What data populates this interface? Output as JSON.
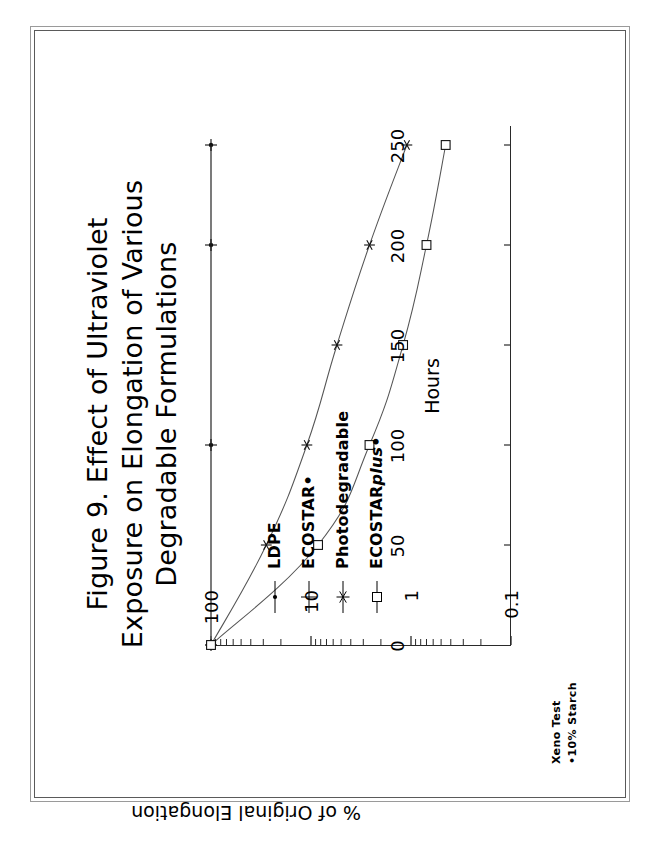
{
  "figure": {
    "title": "Figure 9.  Effect of Ultraviolet\nExposure on Elongation of Various\nDegradable Formulations",
    "footnote": "Xeno Test\n•10% Starch"
  },
  "chart_data": {
    "type": "line",
    "title": "Figure 9.  Effect of Ultraviolet Exposure on Elongation of Various Degradable Formulations",
    "xlabel": "Hours",
    "ylabel": "% of Original Elongation",
    "xlim": [
      0,
      260
    ],
    "ylim": [
      0.1,
      100
    ],
    "yscale": "log",
    "xscale": "linear",
    "grid": false,
    "legend_position": "inside-left",
    "xticks": [
      "0",
      "50",
      "100",
      "150",
      "200",
      "250"
    ],
    "xtick_values": [
      0,
      50,
      100,
      150,
      200,
      250
    ],
    "yticks": [
      "100",
      "10",
      "1",
      "0.1"
    ],
    "ytick_values": [
      100,
      10,
      1,
      0.1
    ],
    "x": [
      0,
      50,
      100,
      150,
      200,
      250
    ],
    "series": [
      {
        "name": "LDPE",
        "marker": "dot",
        "values": [
          100,
          100,
          100,
          100,
          100,
          100
        ]
      },
      {
        "name": "ECOSTAR•",
        "marker": "plus",
        "values": [
          100,
          100,
          100,
          100,
          100,
          100
        ]
      },
      {
        "name": "Photodegradable",
        "marker": "asterisk",
        "values": [
          100,
          28,
          11,
          5.5,
          2.6,
          1.1
        ]
      },
      {
        "name": "ECOSTARplus•",
        "marker": "square",
        "values": [
          100,
          8.5,
          2.6,
          1.2,
          0.7,
          0.45
        ]
      }
    ],
    "annotations": [
      "Xeno Test",
      "•10% Starch"
    ]
  },
  "legend": {
    "items": [
      {
        "label": "LDPE",
        "label_pre": "LDPE",
        "label_ital": "",
        "label_post": "",
        "marker": "dot"
      },
      {
        "label": "ECOSTAR•",
        "label_pre": "ECOSTAR•",
        "label_ital": "",
        "label_post": "",
        "marker": "plus"
      },
      {
        "label": "Photodegradable",
        "label_pre": "Photodegradable",
        "label_ital": "",
        "label_post": "",
        "marker": "asterisk"
      },
      {
        "label": "ECOSTARplus•",
        "label_pre": "ECOSTAR",
        "label_ital": "plus",
        "label_post": "•",
        "marker": "square"
      }
    ]
  },
  "colors": {
    "ink": "#000000",
    "axis": "#2a2a2a",
    "curve": "#555555",
    "frame_outer": "#9a9a9a",
    "frame_inner": "#5a5a5a",
    "paper": "#ffffff"
  }
}
